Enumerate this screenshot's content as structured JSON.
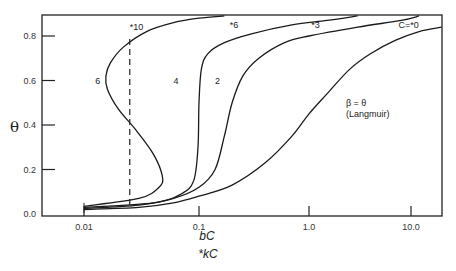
{
  "chart_data": {
    "type": "line",
    "title": "",
    "xlabel": "bC",
    "xlabel2": "*kC",
    "ylabel": "θ",
    "xscale": "log",
    "xlim": [
      0.0035,
      20
    ],
    "ylim": [
      0,
      0.9
    ],
    "grid": false,
    "x_ticks": [
      {
        "value": 0.01,
        "label": "0.01"
      },
      {
        "value": 0.1,
        "label": "0.1"
      },
      {
        "value": 1.0,
        "label": "1.0"
      },
      {
        "value": 10.0,
        "label": "10.0"
      }
    ],
    "y_ticks": [
      {
        "value": 0.0,
        "label": "0.0"
      },
      {
        "value": 0.2,
        "label": "0.2"
      },
      {
        "value": 0.4,
        "label": "0.4"
      },
      {
        "value": 0.6,
        "label": "0.6"
      },
      {
        "value": 0.8,
        "label": "0.8"
      }
    ],
    "series": [
      {
        "name": "C=*0 / β = θ (Langmuir)",
        "points": [
          [
            0.01,
            0.02
          ],
          [
            0.03,
            0.03
          ],
          [
            0.06,
            0.05
          ],
          [
            0.1,
            0.08
          ],
          [
            0.2,
            0.13
          ],
          [
            0.4,
            0.23
          ],
          [
            0.7,
            0.35
          ],
          [
            1.0,
            0.45
          ],
          [
            1.5,
            0.54
          ],
          [
            2.5,
            0.65
          ],
          [
            4,
            0.72
          ],
          [
            7,
            0.78
          ],
          [
            12,
            0.82
          ],
          [
            20,
            0.84
          ]
        ]
      },
      {
        "name": "2 / *3",
        "points": [
          [
            0.01,
            0.025
          ],
          [
            0.03,
            0.04
          ],
          [
            0.06,
            0.07
          ],
          [
            0.1,
            0.12
          ],
          [
            0.14,
            0.2
          ],
          [
            0.17,
            0.35
          ],
          [
            0.2,
            0.5
          ],
          [
            0.25,
            0.62
          ],
          [
            0.35,
            0.7
          ],
          [
            0.6,
            0.77
          ],
          [
            1.0,
            0.8
          ],
          [
            3,
            0.84
          ],
          [
            8,
            0.87
          ],
          [
            12,
            0.89
          ]
        ]
      },
      {
        "name": "4 / *6",
        "points": [
          [
            0.01,
            0.03
          ],
          [
            0.04,
            0.05
          ],
          [
            0.07,
            0.09
          ],
          [
            0.09,
            0.15
          ],
          [
            0.098,
            0.3
          ],
          [
            0.1,
            0.5
          ],
          [
            0.105,
            0.65
          ],
          [
            0.12,
            0.72
          ],
          [
            0.17,
            0.77
          ],
          [
            0.3,
            0.81
          ],
          [
            0.7,
            0.85
          ],
          [
            1.5,
            0.87
          ],
          [
            3,
            0.89
          ]
        ]
      },
      {
        "name": "6 / *10",
        "points": [
          [
            0.01,
            0.035
          ],
          [
            0.03,
            0.07
          ],
          [
            0.045,
            0.12
          ],
          [
            0.048,
            0.17
          ],
          [
            0.04,
            0.27
          ],
          [
            0.028,
            0.38
          ],
          [
            0.02,
            0.47
          ],
          [
            0.016,
            0.56
          ],
          [
            0.0155,
            0.62
          ],
          [
            0.017,
            0.68
          ],
          [
            0.022,
            0.75
          ],
          [
            0.035,
            0.82
          ],
          [
            0.06,
            0.86
          ],
          [
            0.1,
            0.88
          ],
          [
            0.17,
            0.89
          ]
        ]
      }
    ],
    "vertical_dashed_line": {
      "x": 0.025,
      "y_from": 0.04,
      "y_to": 0.8
    },
    "annotations": [
      {
        "text": "*10",
        "x": 0.025,
        "y": 0.84
      },
      {
        "text": "*6",
        "x": 0.19,
        "y": 0.85
      },
      {
        "text": "*3",
        "x": 1.05,
        "y": 0.85
      },
      {
        "text": "C=*0",
        "x": 9.5,
        "y": 0.85
      },
      {
        "text": "6",
        "x": 0.0125,
        "y": 0.6
      },
      {
        "text": "4",
        "x": 0.06,
        "y": 0.6
      },
      {
        "text": "2",
        "x": 0.14,
        "y": 0.6
      },
      {
        "text": "β  = θ",
        "x": 2.3,
        "y": 0.5
      },
      {
        "text": "(Langmuir)",
        "x": 2.3,
        "y": 0.45
      }
    ]
  }
}
